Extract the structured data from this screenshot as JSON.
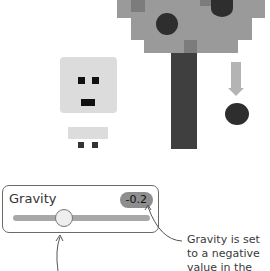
{
  "scene": {
    "character": "pixel-person",
    "tree": "pixel-apple-tree",
    "falling_object": "apple",
    "arrow_direction": "down"
  },
  "gravity_panel": {
    "label": "Gravity",
    "value": "-0.2",
    "slider_position_percent": 35
  },
  "annotations": {
    "right_note": [
      "Gravity is set",
      "to a negative",
      "value in the"
    ]
  },
  "colors": {
    "canopy": "#9a9a9a",
    "canopy_dark": "#7c7c7c",
    "trunk": "#3f3f3f",
    "apple": "#2e2e2e",
    "arrow": "#b4b4b4",
    "person": "#dcdcdc",
    "panel_border": "#6a6a6a",
    "track": "#a8a8a8",
    "thumb": "#eeeeee",
    "badge": "#8e8e8e"
  }
}
